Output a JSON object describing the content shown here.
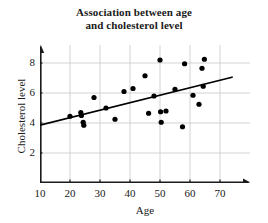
{
  "chart_data": {
    "type": "scatter",
    "title": "Association between age and cholesterol level",
    "title_lines": [
      "Association between age",
      "and cholesterol level"
    ],
    "xlabel": "Age",
    "ylabel": "Cholesterol level",
    "xlim": [
      10,
      78
    ],
    "ylim": [
      0,
      9.2
    ],
    "xticks": [
      10,
      20,
      30,
      40,
      50,
      60,
      70
    ],
    "yticks": [
      2,
      4,
      6,
      8
    ],
    "xtick_labels": [
      "10",
      "20",
      "30",
      "40",
      "50",
      "60",
      "70"
    ],
    "ytick_labels": [
      "2",
      "4",
      "6",
      "8"
    ],
    "grid": true,
    "grid_color": "#c8c8c8",
    "legend": null,
    "axis_color": "#1a1a1a",
    "point_color": "#000000",
    "point_radius": 2.6,
    "series": [
      {
        "name": "observations",
        "points": [
          [
            20.0,
            4.45
          ],
          [
            23.6,
            4.7
          ],
          [
            23.8,
            4.5
          ],
          [
            24.4,
            4.05
          ],
          [
            24.6,
            3.85
          ],
          [
            28.0,
            5.7
          ],
          [
            32.0,
            5.0
          ],
          [
            35.0,
            4.25
          ],
          [
            38.0,
            6.1
          ],
          [
            41.0,
            6.3
          ],
          [
            45.0,
            7.15
          ],
          [
            46.2,
            4.65
          ],
          [
            48.0,
            5.8
          ],
          [
            50.0,
            8.2
          ],
          [
            50.2,
            4.75
          ],
          [
            50.4,
            4.05
          ],
          [
            52.0,
            4.8
          ],
          [
            55.0,
            6.25
          ],
          [
            57.5,
            3.75
          ],
          [
            58.2,
            7.95
          ],
          [
            61.0,
            5.85
          ],
          [
            63.0,
            5.25
          ],
          [
            64.0,
            7.65
          ],
          [
            64.4,
            6.45
          ],
          [
            64.8,
            8.25
          ]
        ]
      }
    ],
    "trendline": {
      "name": "line of best fit",
      "x_start": 10.0,
      "y_start": 3.85,
      "x_end": 74.0,
      "y_end": 7.05,
      "color": "#000000",
      "width": 1.8
    }
  }
}
